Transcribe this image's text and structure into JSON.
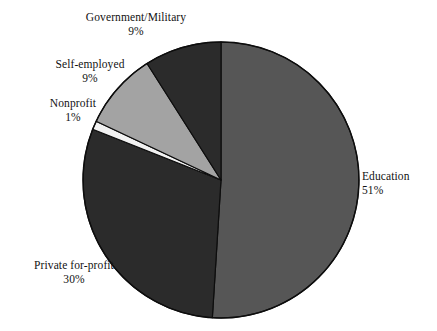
{
  "chart_data": {
    "type": "pie",
    "title": "",
    "subtitle": "",
    "xlabel": "",
    "ylabel": "",
    "legend_position": "none",
    "grid": false,
    "start_angle_deg": 0,
    "direction": "clockwise",
    "categories": [
      "Education",
      "Private for-profit",
      "Nonprofit",
      "Self-employed",
      "Government/Military"
    ],
    "values": [
      51,
      30,
      1,
      9,
      9
    ],
    "value_unit": "%",
    "slices": [
      {
        "label": "Education",
        "value": 51,
        "value_text": "51%",
        "color": "#565656",
        "start_deg": 0,
        "end_deg": 183.6
      },
      {
        "label": "Private for-profit",
        "value": 30,
        "value_text": "30%",
        "color": "#2b2b2b",
        "start_deg": 183.6,
        "end_deg": 291.6
      },
      {
        "label": "Nonprofit",
        "value": 1,
        "value_text": "1%",
        "color": "#f2f2f2",
        "start_deg": 291.6,
        "end_deg": 295.2
      },
      {
        "label": "Self-employed",
        "value": 9,
        "value_text": "9%",
        "color": "#a3a3a3",
        "start_deg": 295.2,
        "end_deg": 327.6
      },
      {
        "label": "Government/Military",
        "value": 9,
        "value_text": "9%",
        "color": "#2b2b2b",
        "start_deg": 327.6,
        "end_deg": 360
      }
    ]
  },
  "geometry": {
    "center_x": 221,
    "center_y": 180,
    "radius": 138
  },
  "style": {
    "background": "#ffffff",
    "outline": "#0d0d0d",
    "text": "#121212"
  },
  "labels": {
    "government": {
      "name": "Government/Military",
      "pct": "9%"
    },
    "selfemployed": {
      "name": "Self-employed",
      "pct": "9%"
    },
    "nonprofit": {
      "name": "Nonprofit",
      "pct": "1%"
    },
    "education": {
      "name": "Education",
      "pct": "51%"
    },
    "private": {
      "name": "Private for-profit",
      "pct": "30%"
    }
  }
}
